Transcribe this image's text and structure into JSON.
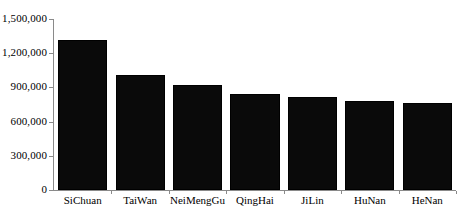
{
  "chart_data": {
    "type": "bar",
    "title": "",
    "xlabel": "",
    "ylabel": "",
    "categories": [
      "SiChuan",
      "TaiWan",
      "NeiMengGu",
      "QingHai",
      "JiLin",
      "HuNan",
      "HeNan"
    ],
    "values": [
      1320000,
      1010000,
      920000,
      840000,
      815000,
      780000,
      762000
    ],
    "ylim": [
      0,
      1500000
    ],
    "ytick_labels": [
      "1,500,000",
      "1,200,000",
      "900,000",
      "600,000",
      "300,000",
      "0"
    ],
    "ytick_values": [
      1500000,
      1200000,
      900000,
      600000,
      300000,
      0
    ],
    "grid": true,
    "legend": false,
    "bar_color": "#0a0a0a",
    "axis_color": "#8a8a8a",
    "gridline_color": "#e6e6e6"
  }
}
